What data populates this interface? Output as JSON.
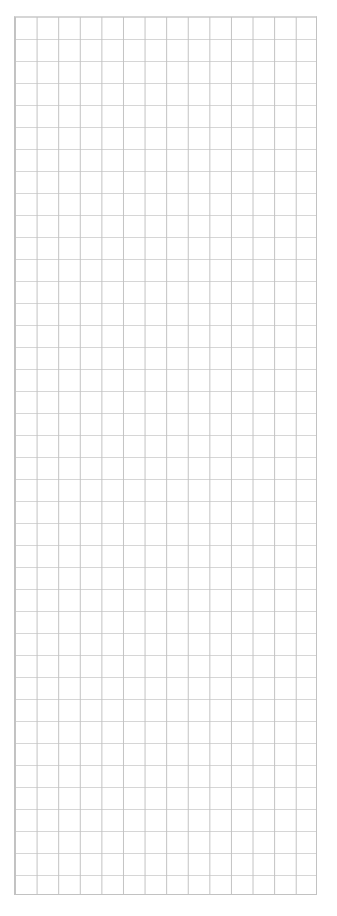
{
  "page": {
    "background_color": "#ffffff",
    "width": 337,
    "height": 916
  },
  "grid": {
    "name": "graph-paper-grid",
    "origin_x": 14,
    "origin_y": 16,
    "width": 303,
    "height": 879,
    "columns": 14,
    "rows": 40,
    "cell_width": 21.6,
    "cell_height": 22.0,
    "line_width": 1,
    "vertical_line_color": "#c2c2c2",
    "horizontal_line_color": "#d6d6d6",
    "border_color": "#c2c2c2",
    "cell_fill_color": "#ffffff"
  }
}
